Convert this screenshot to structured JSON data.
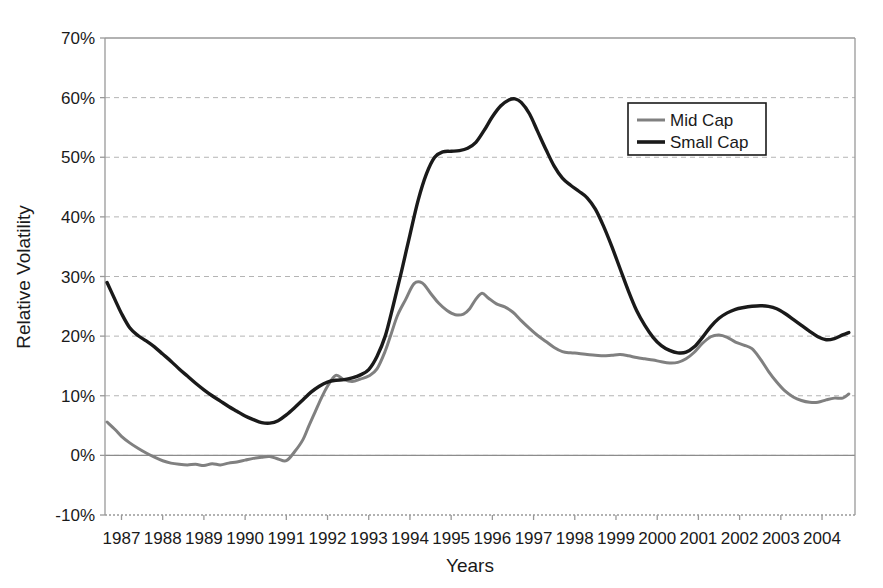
{
  "chart_data": {
    "type": "line",
    "title": "",
    "xlabel": "Years",
    "ylabel": "Relative Volatility",
    "xlim": [
      1986.6,
      2004.8
    ],
    "ylim": [
      -10,
      70
    ],
    "ytick_labels": [
      "70%",
      "60%",
      "50%",
      "40%",
      "30%",
      "20%",
      "10%",
      "0%",
      "-10%"
    ],
    "ytick_values": [
      70,
      60,
      50,
      40,
      30,
      20,
      10,
      0,
      -10
    ],
    "xtick_labels": [
      "1987",
      "1988",
      "1989",
      "1990",
      "1991",
      "1992",
      "1993",
      "1994",
      "1995",
      "1996",
      "1997",
      "1998",
      "1999",
      "2000",
      "2001",
      "2002",
      "2003",
      "2004"
    ],
    "xtick_values": [
      1987,
      1988,
      1989,
      1990,
      1991,
      1992,
      1993,
      1994,
      1995,
      1996,
      1997,
      1998,
      1999,
      2000,
      2001,
      2002,
      2003,
      2004
    ],
    "grid": "horizontal-dashed",
    "legend_position": "top-right",
    "series": [
      {
        "name": "Mid Cap",
        "color": "#808080",
        "width": 3.0,
        "x": [
          1986.65,
          1986.85,
          1987.0,
          1987.2,
          1987.4,
          1987.6,
          1987.8,
          1988.0,
          1988.2,
          1988.4,
          1988.6,
          1988.8,
          1989.0,
          1989.2,
          1989.4,
          1989.6,
          1989.8,
          1990.0,
          1990.2,
          1990.4,
          1990.6,
          1990.8,
          1991.0,
          1991.2,
          1991.4,
          1991.55,
          1991.7,
          1991.85,
          1992.0,
          1992.2,
          1992.4,
          1992.6,
          1992.8,
          1993.0,
          1993.2,
          1993.4,
          1993.55,
          1993.7,
          1993.9,
          1994.1,
          1994.3,
          1994.5,
          1994.7,
          1994.9,
          1995.1,
          1995.3,
          1995.45,
          1995.6,
          1995.75,
          1995.9,
          1996.1,
          1996.3,
          1996.5,
          1996.7,
          1996.9,
          1997.1,
          1997.3,
          1997.5,
          1997.7,
          1997.9,
          1998.1,
          1998.3,
          1998.5,
          1998.7,
          1998.9,
          1999.1,
          1999.3,
          1999.5,
          1999.7,
          1999.9,
          2000.1,
          2000.3,
          2000.5,
          2000.7,
          2000.9,
          2001.1,
          2001.3,
          2001.5,
          2001.7,
          2001.9,
          2002.1,
          2002.3,
          2002.5,
          2002.7,
          2002.9,
          2003.1,
          2003.3,
          2003.5,
          2003.7,
          2003.9,
          2004.1,
          2004.3,
          2004.5,
          2004.65
        ],
        "y": [
          5.6,
          4.3,
          3.2,
          2.1,
          1.2,
          0.4,
          -0.3,
          -0.9,
          -1.3,
          -1.5,
          -1.6,
          -1.5,
          -1.7,
          -1.4,
          -1.6,
          -1.3,
          -1.1,
          -0.8,
          -0.5,
          -0.3,
          -0.2,
          -0.6,
          -0.9,
          0.6,
          2.6,
          5.0,
          7.3,
          9.6,
          11.6,
          13.4,
          12.7,
          12.4,
          12.8,
          13.3,
          14.5,
          17.5,
          20.5,
          23.5,
          26.2,
          28.8,
          28.9,
          27.2,
          25.5,
          24.3,
          23.6,
          23.7,
          24.6,
          26.2,
          27.2,
          26.4,
          25.4,
          24.9,
          24.0,
          22.6,
          21.3,
          20.1,
          19.1,
          18.1,
          17.4,
          17.2,
          17.1,
          16.9,
          16.8,
          16.7,
          16.8,
          16.9,
          16.7,
          16.4,
          16.2,
          16.0,
          15.7,
          15.5,
          15.6,
          16.2,
          17.3,
          18.8,
          19.9,
          20.2,
          19.8,
          19.0,
          18.5,
          17.9,
          16.2,
          14.1,
          12.3,
          10.8,
          9.8,
          9.2,
          8.9,
          8.9,
          9.3,
          9.6,
          9.6,
          10.3
        ]
      },
      {
        "name": "Small Cap",
        "color": "#1a1a1a",
        "width": 3.4,
        "x": [
          1986.65,
          1986.85,
          1987.0,
          1987.2,
          1987.4,
          1987.6,
          1987.8,
          1988.0,
          1988.2,
          1988.4,
          1988.6,
          1988.8,
          1989.0,
          1989.2,
          1989.4,
          1989.6,
          1989.8,
          1990.0,
          1990.2,
          1990.4,
          1990.6,
          1990.8,
          1991.0,
          1991.2,
          1991.4,
          1991.6,
          1991.8,
          1992.0,
          1992.2,
          1992.4,
          1992.6,
          1992.8,
          1993.0,
          1993.2,
          1993.4,
          1993.6,
          1993.8,
          1994.0,
          1994.2,
          1994.4,
          1994.6,
          1994.8,
          1995.0,
          1995.2,
          1995.4,
          1995.6,
          1995.8,
          1996.0,
          1996.2,
          1996.4,
          1996.55,
          1996.7,
          1996.9,
          1997.1,
          1997.3,
          1997.5,
          1997.7,
          1997.9,
          1998.1,
          1998.3,
          1998.5,
          1998.7,
          1998.9,
          1999.1,
          1999.3,
          1999.5,
          1999.7,
          1999.9,
          2000.1,
          2000.3,
          2000.5,
          2000.7,
          2000.9,
          2001.1,
          2001.3,
          2001.5,
          2001.7,
          2001.9,
          2002.1,
          2002.3,
          2002.5,
          2002.7,
          2002.9,
          2003.1,
          2003.3,
          2003.5,
          2003.7,
          2003.9,
          2004.1,
          2004.3,
          2004.5,
          2004.65
        ],
        "y": [
          29.0,
          26.0,
          23.8,
          21.4,
          20.1,
          19.2,
          18.2,
          17.0,
          15.8,
          14.5,
          13.3,
          12.1,
          11.0,
          10.0,
          9.1,
          8.2,
          7.4,
          6.6,
          6.0,
          5.5,
          5.4,
          5.8,
          6.8,
          8.0,
          9.3,
          10.6,
          11.6,
          12.3,
          12.6,
          12.7,
          13.0,
          13.5,
          14.4,
          16.6,
          20.0,
          25.3,
          31.0,
          37.0,
          42.8,
          47.2,
          50.0,
          50.9,
          51.0,
          51.1,
          51.5,
          52.5,
          54.5,
          56.8,
          58.6,
          59.6,
          59.8,
          59.2,
          57.3,
          54.3,
          51.3,
          48.5,
          46.5,
          45.3,
          44.3,
          43.2,
          41.3,
          38.4,
          35.0,
          31.3,
          27.6,
          24.3,
          21.8,
          19.8,
          18.4,
          17.6,
          17.2,
          17.3,
          18.2,
          19.8,
          21.6,
          23.0,
          23.9,
          24.5,
          24.8,
          25.0,
          25.1,
          25.0,
          24.6,
          23.8,
          22.8,
          21.8,
          20.8,
          19.9,
          19.4,
          19.6,
          20.2,
          20.6
        ]
      }
    ]
  },
  "legend": {
    "items": [
      {
        "label": "Mid  Cap",
        "color": "#808080"
      },
      {
        "label": "Small  Cap",
        "color": "#1a1a1a"
      }
    ]
  },
  "axes": {
    "x_title": "Years",
    "y_title": "Relative Volatility"
  },
  "colors": {
    "mid_cap": "#808080",
    "small_cap": "#1a1a1a",
    "grid": "#b4b4b4",
    "frame": "#999999",
    "zero_line": "#8c8c8c",
    "background": "#ffffff"
  }
}
